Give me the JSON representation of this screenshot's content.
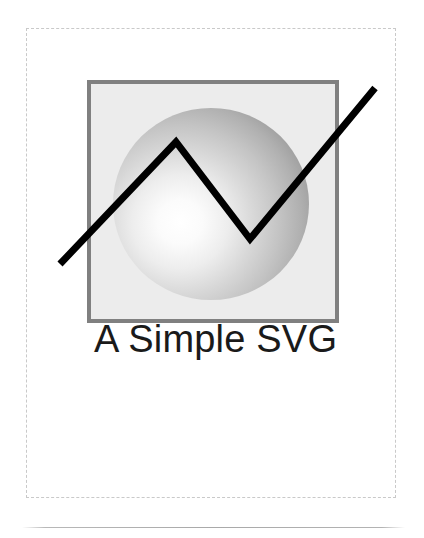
{
  "document": {
    "title": "A Simple SVG",
    "background_color": "#ffffff",
    "width": 424,
    "height": 538
  },
  "canvas_outline": {
    "name": "svg-viewport-outline",
    "style": "dashed",
    "stroke_color": "#c9c9c9",
    "stroke_width": 1,
    "x": 26,
    "y": 28,
    "width": 370,
    "height": 470
  },
  "figure": {
    "caption": "A Simple SVG",
    "caption_color": "#1a1a1a",
    "caption_font_size": "38px",
    "caption_x": 156,
    "caption_baseline_y": 351,
    "frame": {
      "name": "gray-framed-square",
      "x": 60,
      "y": 51,
      "width": 252,
      "height": 243,
      "fill": "#ececec",
      "stroke": "#808080",
      "stroke_width": 4
    },
    "sphere": {
      "name": "shaded-sphere",
      "center_x": 184,
      "center_y": 175,
      "radius_x": 98,
      "radius_y": 96,
      "gradient_type": "radial",
      "highlight_x": 153,
      "highlight_y": 193,
      "highlight_color": "#ffffff",
      "mid_color": "#c2c2c2",
      "edge_color": "#9a9a9a"
    },
    "polyline": {
      "name": "zigzag-trend-polyline",
      "stroke": "#000000",
      "stroke_width": 7,
      "fill": "none",
      "points": [
        {
          "x": 33,
          "y": 235
        },
        {
          "x": 149,
          "y": 113
        },
        {
          "x": 223,
          "y": 210
        },
        {
          "x": 348,
          "y": 59
        }
      ]
    }
  },
  "footer_rule": {
    "name": "footer-divider",
    "x": 22,
    "y": 527,
    "width": 383,
    "color": "#a9a9a9"
  }
}
